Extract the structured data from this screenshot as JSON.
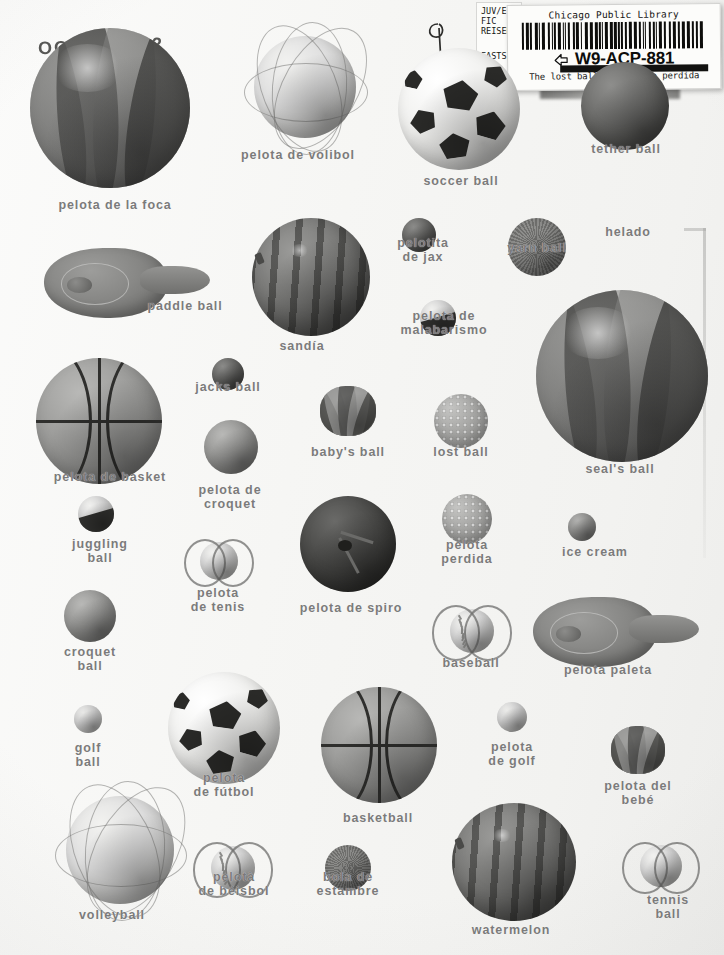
{
  "page": {
    "kind": "bilingual picture dictionary page",
    "background_color": "#f7f7f5",
    "label_color": "#7b7b7b",
    "width": 724,
    "height": 955
  },
  "date_stamp": {
    "month": "OCT",
    "year": "2002"
  },
  "call_slip": {
    "line1": "JUV/E",
    "line2": "FIC",
    "line3": "REISER",
    "branch": "EASTSI"
  },
  "library_label": {
    "library_name": "Chicago Public Library",
    "control_number": "W9-ACP-881",
    "title_line": "The lost ball= La pelota perdida",
    "icon": "hand-pointing-icon"
  },
  "objects": [
    {
      "name": "pelota-de-la-foca",
      "label": "pelota de la foca",
      "kind": "beach-ball",
      "x": 30,
      "y": 28,
      "w": 160,
      "h": 160,
      "label_x": 115,
      "label_y": 198
    },
    {
      "name": "pelota-de-volibol",
      "label": "pelota de volibol",
      "kind": "volleyball",
      "x": 254,
      "y": 36,
      "w": 102,
      "h": 102,
      "label_x": 298,
      "label_y": 148
    },
    {
      "name": "soccer-ball",
      "label": "soccer ball",
      "kind": "soccer",
      "x": 398,
      "y": 48,
      "w": 122,
      "h": 122,
      "label_x": 461,
      "label_y": 174
    },
    {
      "name": "tether-ball",
      "label": "tether ball",
      "kind": "dark-ball",
      "x": 581,
      "y": 62,
      "w": 88,
      "h": 88,
      "label_x": 626,
      "label_y": 142
    },
    {
      "name": "paddle-ball",
      "label": "paddle ball",
      "kind": "paddle",
      "x": 44,
      "y": 248,
      "w": 166,
      "h": 70,
      "label_x": 185,
      "label_y": 299
    },
    {
      "name": "sandia",
      "label": "sandía",
      "kind": "watermelon",
      "x": 252,
      "y": 218,
      "w": 118,
      "h": 118,
      "label_x": 302,
      "label_y": 339
    },
    {
      "name": "pelotita-de-jax",
      "label": "pelotita\nde jax",
      "kind": "dark-ball",
      "x": 402,
      "y": 218,
      "w": 34,
      "h": 34,
      "label_x": 423,
      "label_y": 236
    },
    {
      "name": "yarn-ball",
      "label": "yarn ball",
      "kind": "yarn",
      "x": 508,
      "y": 218,
      "w": 58,
      "h": 58,
      "label_x": 537,
      "label_y": 241
    },
    {
      "name": "helado",
      "label": "helado",
      "kind": "label-only",
      "x": 0,
      "y": 0,
      "w": 0,
      "h": 0,
      "label_x": 628,
      "label_y": 225
    },
    {
      "name": "pelota-de-malabarismo",
      "label": "pelota de\nmalabarismo",
      "kind": "two-tone",
      "x": 420,
      "y": 300,
      "w": 36,
      "h": 36,
      "label_x": 444,
      "label_y": 309
    },
    {
      "name": "seals-ball",
      "label": "seal's ball",
      "kind": "beach-ball",
      "x": 536,
      "y": 290,
      "w": 172,
      "h": 172,
      "label_x": 620,
      "label_y": 462
    },
    {
      "name": "pelota-de-basket",
      "label": "pelota de basket",
      "kind": "basketball",
      "x": 36,
      "y": 358,
      "w": 126,
      "h": 126,
      "label_x": 110,
      "label_y": 470
    },
    {
      "name": "jacks-ball",
      "label": "jacks ball",
      "kind": "dark-ball",
      "x": 212,
      "y": 358,
      "w": 32,
      "h": 32,
      "label_x": 228,
      "label_y": 380
    },
    {
      "name": "babys-ball",
      "label": "baby's ball",
      "kind": "plush",
      "x": 320,
      "y": 386,
      "w": 56,
      "h": 50,
      "label_x": 348,
      "label_y": 445
    },
    {
      "name": "lost-ball",
      "label": "lost ball",
      "kind": "bumpy",
      "x": 434,
      "y": 394,
      "w": 54,
      "h": 54,
      "label_x": 461,
      "label_y": 445
    },
    {
      "name": "pelota-de-croquet",
      "label": "pelota de\ncroquet",
      "kind": "mid-ball",
      "x": 204,
      "y": 420,
      "w": 54,
      "h": 54,
      "label_x": 230,
      "label_y": 483
    },
    {
      "name": "juggling-ball",
      "label": "juggling\nball",
      "kind": "two-tone",
      "x": 78,
      "y": 496,
      "w": 36,
      "h": 36,
      "label_x": 100,
      "label_y": 537
    },
    {
      "name": "pelota-de-tenis",
      "label": "pelota\nde tenis",
      "kind": "tennis",
      "x": 200,
      "y": 542,
      "w": 38,
      "h": 38,
      "label_x": 218,
      "label_y": 586
    },
    {
      "name": "pelota-de-spiro",
      "label": "pelota de spiro",
      "kind": "spiro",
      "x": 300,
      "y": 496,
      "w": 96,
      "h": 96,
      "label_x": 351,
      "label_y": 601
    },
    {
      "name": "pelota-perdida",
      "label": "pelota\nperdida",
      "kind": "bumpy",
      "x": 442,
      "y": 494,
      "w": 50,
      "h": 50,
      "label_x": 467,
      "label_y": 538
    },
    {
      "name": "ice-cream",
      "label": "ice cream",
      "kind": "mid-ball",
      "x": 568,
      "y": 513,
      "w": 28,
      "h": 28,
      "label_x": 595,
      "label_y": 545
    },
    {
      "name": "croquet-ball",
      "label": "croquet\nball",
      "kind": "mid-ball",
      "x": 64,
      "y": 590,
      "w": 52,
      "h": 52,
      "label_x": 90,
      "label_y": 645
    },
    {
      "name": "baseball",
      "label": "baseball",
      "kind": "baseball",
      "x": 450,
      "y": 609,
      "w": 44,
      "h": 44,
      "label_x": 471,
      "label_y": 656
    },
    {
      "name": "pelota-paleta",
      "label": "pelota paleta",
      "kind": "paddle",
      "x": 533,
      "y": 597,
      "w": 166,
      "h": 70,
      "label_x": 608,
      "label_y": 663
    },
    {
      "name": "golf-ball",
      "label": "golf\nball",
      "kind": "light-ball",
      "x": 74,
      "y": 705,
      "w": 28,
      "h": 28,
      "label_x": 88,
      "label_y": 741
    },
    {
      "name": "pelota-de-futbol",
      "label": "pelota\nde fútbol",
      "kind": "soccer",
      "x": 168,
      "y": 672,
      "w": 112,
      "h": 112,
      "label_x": 224,
      "label_y": 771
    },
    {
      "name": "basketball",
      "label": "basketball",
      "kind": "basketball",
      "x": 321,
      "y": 687,
      "w": 116,
      "h": 116,
      "label_x": 378,
      "label_y": 811
    },
    {
      "name": "pelota-de-golf",
      "label": "pelota\nde golf",
      "kind": "light-ball",
      "x": 497,
      "y": 702,
      "w": 30,
      "h": 30,
      "label_x": 512,
      "label_y": 740
    },
    {
      "name": "pelota-del-bebe",
      "label": "pelota del bebé",
      "kind": "plush",
      "x": 611,
      "y": 726,
      "w": 54,
      "h": 48,
      "label_x": 638,
      "label_y": 779
    },
    {
      "name": "volleyball",
      "label": "volleyball",
      "kind": "volleyball",
      "x": 66,
      "y": 796,
      "w": 108,
      "h": 108,
      "label_x": 112,
      "label_y": 908
    },
    {
      "name": "pelota-de-beisbol",
      "label": "pelotà\nde béisbol",
      "kind": "baseball",
      "x": 211,
      "y": 846,
      "w": 44,
      "h": 44,
      "label_x": 234,
      "label_y": 870
    },
    {
      "name": "bola-de-estambre",
      "label": "bola de\nestambre",
      "kind": "yarn",
      "x": 325,
      "y": 845,
      "w": 46,
      "h": 46,
      "label_x": 348,
      "label_y": 870
    },
    {
      "name": "watermelon",
      "label": "watermelon",
      "kind": "watermelon",
      "x": 452,
      "y": 803,
      "w": 124,
      "h": 118,
      "label_x": 511,
      "label_y": 923
    },
    {
      "name": "tennis-ball",
      "label": "tennis ball",
      "kind": "tennis",
      "x": 640,
      "y": 845,
      "w": 42,
      "h": 42,
      "label_x": 668,
      "label_y": 893
    }
  ]
}
